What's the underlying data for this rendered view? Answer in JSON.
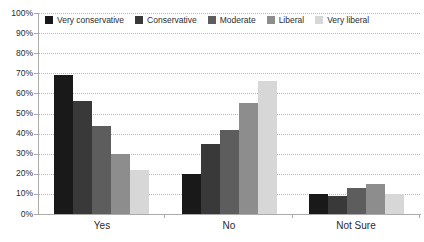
{
  "chart_data": {
    "type": "bar",
    "title": "",
    "categories": [
      "Yes",
      "No",
      "Not Sure"
    ],
    "series": [
      {
        "name": "Very conservative",
        "color": "#191919",
        "values": [
          69,
          20,
          10
        ]
      },
      {
        "name": "Conservative",
        "color": "#393939",
        "values": [
          56,
          35,
          9
        ]
      },
      {
        "name": "Moderate",
        "color": "#5d5d5d",
        "values": [
          44,
          42,
          13
        ]
      },
      {
        "name": "Liberal",
        "color": "#8d8d8d",
        "values": [
          30,
          55,
          15
        ]
      },
      {
        "name": "Very liberal",
        "color": "#d7d7d7",
        "values": [
          22,
          66,
          10
        ]
      }
    ],
    "xlabel": "",
    "ylabel": "",
    "ylim": [
      0,
      100
    ],
    "ytick_step": 10,
    "ytick_labels": [
      "0%",
      "10%",
      "20%",
      "30%",
      "40%",
      "50%",
      "60%",
      "70%",
      "80%",
      "90%",
      "100%"
    ],
    "grid": "horizontal-dotted",
    "legend_position": "top-inside"
  },
  "style": {
    "axis_color": "#ababab",
    "grid_color": "#b9b9b9",
    "label_color": "#2b2b2b",
    "background": "#ffffff"
  }
}
